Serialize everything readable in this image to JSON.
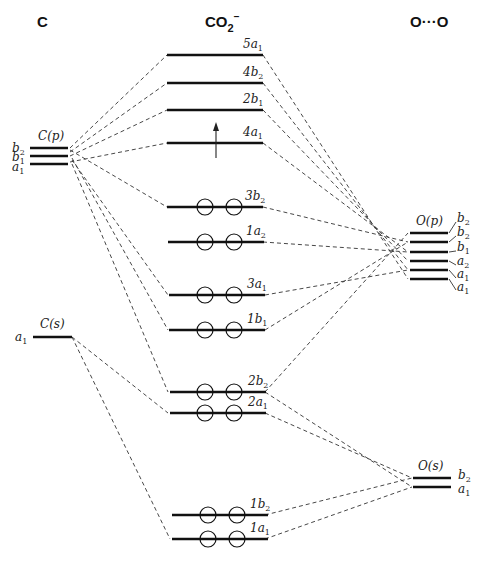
{
  "headers": {
    "left": "C",
    "center": "CO2",
    "center_sub": "2",
    "center_sup": "−",
    "center_base": "CO",
    "right": "O···O"
  },
  "left": {
    "cp_label": "C(p)",
    "cp_levels": [
      {
        "sym": "b",
        "sub": "2"
      },
      {
        "sym": "b",
        "sub": "1"
      },
      {
        "sym": "a",
        "sub": "1"
      }
    ],
    "cs_label": "C(s)",
    "cs_level": {
      "sym": "a",
      "sub": "1"
    }
  },
  "center": {
    "levels": [
      {
        "name": "5a",
        "sub": "1",
        "electrons": 0
      },
      {
        "name": "4b",
        "sub": "2",
        "electrons": 0
      },
      {
        "name": "2b",
        "sub": "1",
        "electrons": 0
      },
      {
        "name": "4a",
        "sub": "1",
        "electrons": 1
      },
      {
        "name": "3b",
        "sub": "2",
        "electrons": 2
      },
      {
        "name": "1a",
        "sub": "2",
        "electrons": 2
      },
      {
        "name": "3a",
        "sub": "1",
        "electrons": 2
      },
      {
        "name": "1b",
        "sub": "1",
        "electrons": 2
      },
      {
        "name": "2b",
        "sub": "2",
        "electrons": 2
      },
      {
        "name": "2a",
        "sub": "1",
        "electrons": 2
      },
      {
        "name": "1b",
        "sub": "2",
        "electrons": 2
      },
      {
        "name": "1a",
        "sub": "1",
        "electrons": 2
      }
    ],
    "unpaired_electron_on": "4a1"
  },
  "right": {
    "op_label": "O(p)",
    "op_levels": [
      {
        "sym": "b",
        "sub": "2"
      },
      {
        "sym": "b",
        "sub": "2"
      },
      {
        "sym": "b",
        "sub": "1"
      },
      {
        "sym": "a",
        "sub": "2"
      },
      {
        "sym": "a",
        "sub": "1"
      },
      {
        "sym": "a",
        "sub": "1"
      }
    ],
    "os_label": "O(s)",
    "os_levels": [
      {
        "sym": "b",
        "sub": "2"
      },
      {
        "sym": "a",
        "sub": "1"
      }
    ]
  }
}
